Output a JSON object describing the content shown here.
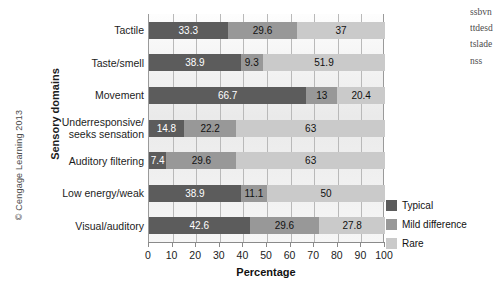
{
  "figure": {
    "copyright": "© Cengage Learning 2013",
    "edge_text": "ssbvnttdesdtsladenss"
  },
  "chart_data": {
    "type": "bar",
    "orientation": "horizontal",
    "stacked": true,
    "title": "",
    "xlabel": "Percentage",
    "ylabel": "Sensory domains",
    "xlim": [
      0,
      100
    ],
    "grid": true,
    "legend_position": "right",
    "xticks": [
      "0",
      "10",
      "20",
      "30",
      "40",
      "50",
      "60",
      "70",
      "80",
      "90",
      "100"
    ],
    "categories": [
      "Tactile",
      "Taste/smell",
      "Movement",
      "Underresponsive/\nseeks sensation",
      "Auditory filtering",
      "Low energy/weak",
      "Visual/auditory"
    ],
    "series": [
      {
        "name": "Typical",
        "color": "#5c5c5c",
        "values": [
          33.3,
          38.9,
          66.7,
          14.8,
          7.4,
          38.9,
          42.6
        ],
        "labels": [
          "33.3",
          "38.9",
          "66.7",
          "14.8",
          "7.4",
          "38.9",
          "42.6"
        ]
      },
      {
        "name": "Mild difference",
        "color": "#989898",
        "values": [
          29.6,
          9.3,
          13,
          22.2,
          29.6,
          11.1,
          29.6
        ],
        "labels": [
          "29.6",
          "9.3",
          "13",
          "22.2",
          "29.6",
          "11.1",
          "29.6"
        ]
      },
      {
        "name": "Rare",
        "color": "#cacaca",
        "values": [
          37,
          51.9,
          20.4,
          63,
          63,
          50,
          27.8
        ],
        "labels": [
          "37",
          "51.9",
          "20.4",
          "63",
          "63",
          "50",
          "27.8"
        ]
      }
    ]
  },
  "legend": {
    "items": [
      {
        "label": "Typical",
        "color": "#5c5c5c"
      },
      {
        "label": "Mild difference",
        "color": "#989898"
      },
      {
        "label": "Rare",
        "color": "#cacaca"
      }
    ]
  }
}
